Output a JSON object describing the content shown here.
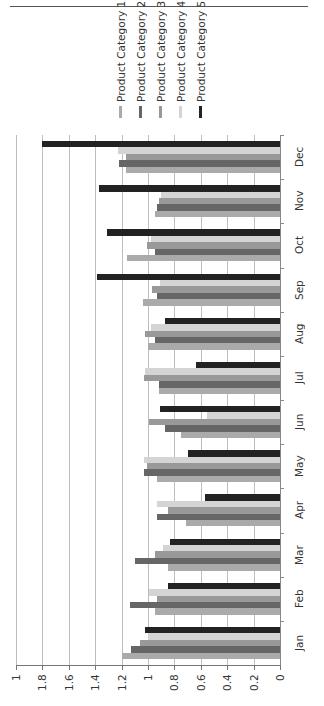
{
  "chart_data": {
    "type": "bar",
    "orientation": "vertical-columns-rotated-90deg",
    "title": "",
    "xlabel": "",
    "ylabel": "",
    "categories": [
      "Jan",
      "Feb",
      "Mar",
      "Apr",
      "May",
      "Jun",
      "Jul",
      "Aug",
      "Sep",
      "Oct",
      "Nov",
      "Dec"
    ],
    "series": [
      {
        "name": "Product Category 1",
        "color": "#aaaaaa",
        "values": [
          1.2,
          0.95,
          0.85,
          0.71,
          0.93,
          0.75,
          0.92,
          1.0,
          1.04,
          1.16,
          0.95,
          1.17
        ]
      },
      {
        "name": "Product Category 2",
        "color": "#666666",
        "values": [
          1.13,
          1.14,
          1.1,
          0.93,
          1.03,
          0.87,
          0.92,
          0.95,
          0.93,
          0.95,
          0.93,
          1.22
        ]
      },
      {
        "name": "Product Category 3",
        "color": "#999999",
        "values": [
          1.06,
          0.93,
          0.95,
          0.85,
          1.01,
          0.99,
          1.03,
          1.02,
          0.97,
          1.01,
          0.92,
          1.17
        ]
      },
      {
        "name": "Product Category 4",
        "color": "#d4d4d4",
        "values": [
          1.0,
          0.99,
          0.89,
          0.93,
          1.03,
          0.55,
          1.02,
          0.98,
          0.91,
          0.98,
          0.9,
          1.23
        ]
      },
      {
        "name": "Product Category 5",
        "color": "#222222",
        "values": [
          1.02,
          0.85,
          0.83,
          0.57,
          0.7,
          0.91,
          0.64,
          0.87,
          1.39,
          1.31,
          1.37,
          1.8
        ]
      }
    ],
    "ylim": [
      0,
      2
    ],
    "y_ticks": [
      "0",
      "0.2",
      "0.4",
      "0.6",
      "0.8",
      "1",
      "1.2",
      "1.4",
      "1.6",
      "1.8",
      "1"
    ],
    "grid": true,
    "legend_position": "top"
  },
  "legend": {
    "items": [
      {
        "label": "Product Category 1",
        "color": "#aaaaaa"
      },
      {
        "label": "Product Category 2",
        "color": "#666666"
      },
      {
        "label": "Product Category 3",
        "color": "#999999"
      },
      {
        "label": "Product Category 4",
        "color": "#d4d4d4"
      },
      {
        "label": "Product Category 5",
        "color": "#222222"
      }
    ]
  }
}
